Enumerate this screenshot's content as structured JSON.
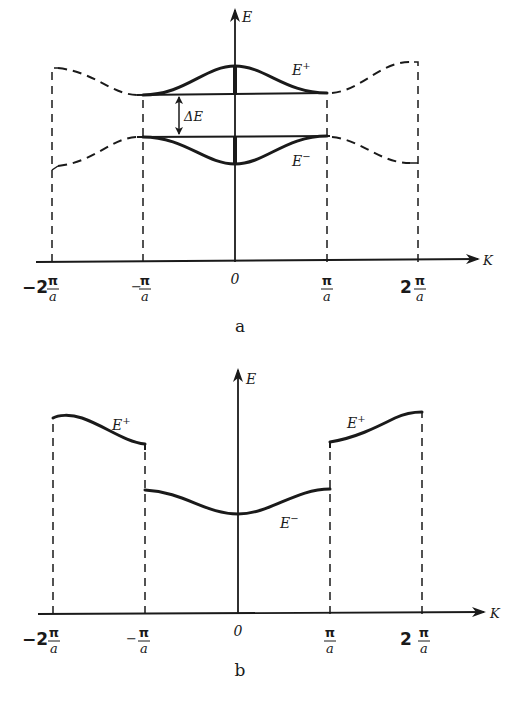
{
  "panel_a": {
    "caption": "a",
    "y_axis_label": "E",
    "x_axis_label": "K",
    "gap_label": "ΔE",
    "upper_band_label": "E",
    "upper_band_sup": "+",
    "lower_band_label": "E",
    "lower_band_sup": "−",
    "ticks": [
      {
        "prefix": "−2",
        "num": "π",
        "den": "a"
      },
      {
        "prefix": "−",
        "num": "π",
        "den": "a"
      },
      {
        "prefix": "",
        "num": "",
        "den": "",
        "zero": "0"
      },
      {
        "prefix": "",
        "num": "π",
        "den": "a"
      },
      {
        "prefix": "2",
        "num": "π",
        "den": "a"
      }
    ]
  },
  "panel_b": {
    "caption": "b",
    "y_axis_label": "E",
    "x_axis_label": "K",
    "left_band_label": "E",
    "left_band_sup": "+",
    "right_band_label": "E",
    "right_band_sup": "+",
    "center_band_label": "E",
    "center_band_sup": "−",
    "ticks": [
      {
        "prefix": "−2",
        "num": "π",
        "den": "a"
      },
      {
        "prefix": "−",
        "num": "π",
        "den": "a"
      },
      {
        "prefix": "",
        "num": "",
        "den": "",
        "zero": "0"
      },
      {
        "prefix": "",
        "num": "π",
        "den": "a"
      },
      {
        "prefix": "2",
        "num": "π",
        "den": "a"
      }
    ]
  },
  "colors": {
    "ink": "#1a1a1a",
    "paper": "#ffffff"
  }
}
